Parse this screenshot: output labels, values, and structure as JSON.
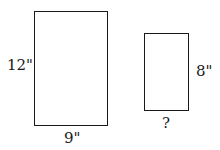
{
  "diagram": {
    "large_rectangle": {
      "height_label": "12\"",
      "width_label": "9\""
    },
    "small_rectangle": {
      "height_label": "8\"",
      "width_label": "?"
    }
  }
}
